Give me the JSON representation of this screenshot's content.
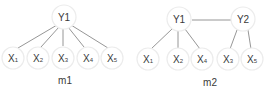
{
  "diagram": {
    "type": "graphical-models-comparison",
    "colors": {
      "node_fill": "#ffffff",
      "node_stroke": "#ececec",
      "edge": "#8a8a8a",
      "text": "#3a3a3a"
    },
    "models": [
      {
        "label": "m1",
        "nodes": [
          {
            "id": "Y1",
            "base": "Y",
            "sub": "1",
            "kind": "latent"
          },
          {
            "id": "X1",
            "base": "X",
            "sub": "1",
            "kind": "observed"
          },
          {
            "id": "X2",
            "base": "X",
            "sub": "2",
            "kind": "observed"
          },
          {
            "id": "X3",
            "base": "X",
            "sub": "3",
            "kind": "observed"
          },
          {
            "id": "X4",
            "base": "X",
            "sub": "4",
            "kind": "observed"
          },
          {
            "id": "X5",
            "base": "X",
            "sub": "5",
            "kind": "observed"
          }
        ],
        "edges": [
          [
            "Y1",
            "X1"
          ],
          [
            "Y1",
            "X2"
          ],
          [
            "Y1",
            "X3"
          ],
          [
            "Y1",
            "X4"
          ],
          [
            "Y1",
            "X5"
          ]
        ]
      },
      {
        "label": "m2",
        "nodes": [
          {
            "id": "Y1",
            "base": "Y",
            "sub": "1",
            "kind": "latent"
          },
          {
            "id": "Y2",
            "base": "Y",
            "sub": "2",
            "kind": "latent"
          },
          {
            "id": "X1",
            "base": "X",
            "sub": "1",
            "kind": "observed"
          },
          {
            "id": "X2",
            "base": "X",
            "sub": "2",
            "kind": "observed"
          },
          {
            "id": "X4",
            "base": "X",
            "sub": "4",
            "kind": "observed"
          },
          {
            "id": "X3",
            "base": "X",
            "sub": "3",
            "kind": "observed"
          },
          {
            "id": "X5",
            "base": "X",
            "sub": "5",
            "kind": "observed"
          }
        ],
        "edges": [
          [
            "Y1",
            "Y2"
          ],
          [
            "Y1",
            "X1"
          ],
          [
            "Y1",
            "X2"
          ],
          [
            "Y1",
            "X4"
          ],
          [
            "Y2",
            "X3"
          ],
          [
            "Y2",
            "X5"
          ]
        ]
      }
    ]
  }
}
